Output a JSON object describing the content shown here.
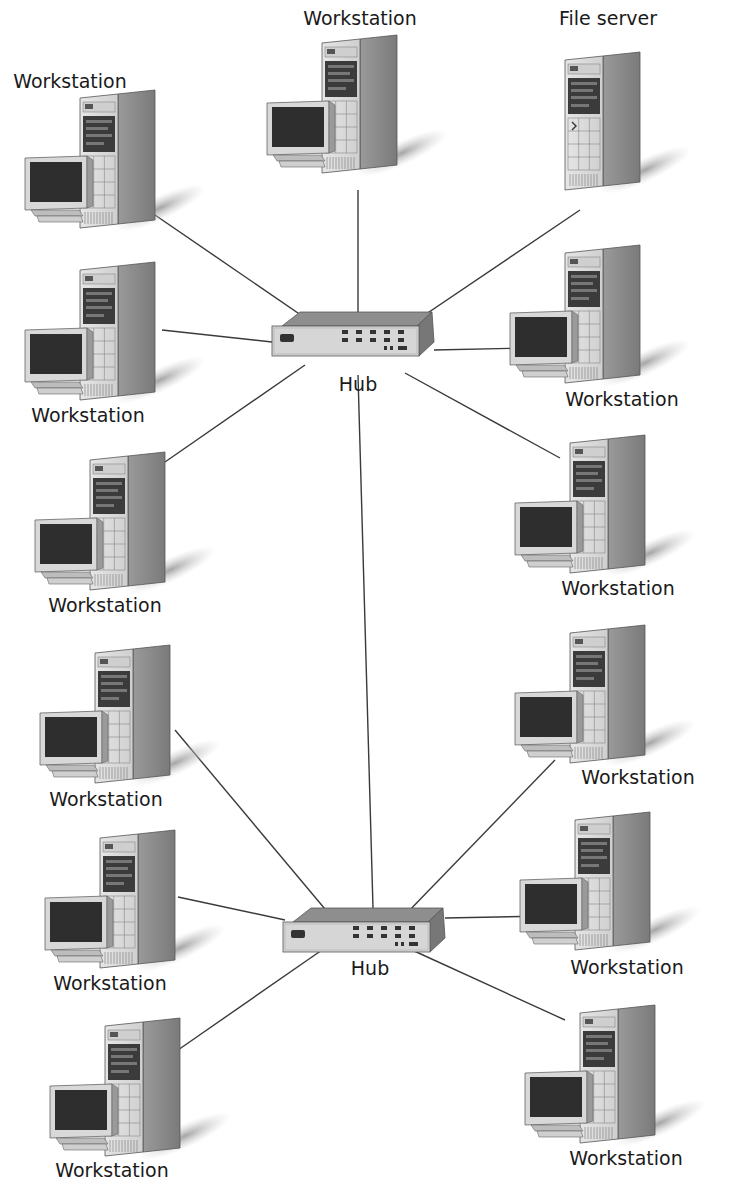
{
  "diagram": {
    "colors": {
      "line": "#3a3a3a",
      "case_front": "#dcdcdc",
      "case_side": "#8c8c8c",
      "screen": "#2e2e2e",
      "shadow": "#b0b0b0",
      "text": "#1a1a1a"
    },
    "hubs": [
      {
        "id": "hub1",
        "label": "Hub",
        "x": 272,
        "y": 312,
        "label_x": 358,
        "label_y": 391
      },
      {
        "id": "hub2",
        "label": "Hub",
        "x": 283,
        "y": 908,
        "label_x": 370,
        "label_y": 975
      }
    ],
    "nodes": [
      {
        "id": "n1",
        "type": "workstation",
        "label": "Workstation",
        "x": 20,
        "y": 90,
        "label_x": 70,
        "label_y": 88,
        "hub": "hub1",
        "from": [
          155,
          215
        ],
        "to": [
          330,
          335
        ]
      },
      {
        "id": "n2",
        "type": "workstation",
        "label": "Workstation",
        "x": 262,
        "y": 35,
        "label_x": 360,
        "label_y": 25,
        "hub": "hub1",
        "from": [
          358,
          190
        ],
        "to": [
          358,
          320
        ]
      },
      {
        "id": "n3",
        "type": "fileserver",
        "label": "File server",
        "label_x": 608,
        "label_y": 25,
        "x": 545,
        "y": 52,
        "hub": "hub1",
        "from": [
          580,
          210
        ],
        "to": [
          398,
          333
        ]
      },
      {
        "id": "n4",
        "type": "workstation",
        "label": "Workstation",
        "x": 20,
        "y": 262,
        "label_x": 88,
        "label_y": 422,
        "hub": "hub1",
        "from": [
          162,
          330
        ],
        "to": [
          272,
          342
        ]
      },
      {
        "id": "n5",
        "type": "workstation",
        "label": "Workstation",
        "x": 505,
        "y": 245,
        "label_x": 622,
        "label_y": 406,
        "hub": "hub1",
        "from": [
          434,
          350
        ],
        "to": [
          528,
          348
        ]
      },
      {
        "id": "n6",
        "type": "workstation",
        "label": "Workstation",
        "x": 30,
        "y": 452,
        "label_x": 105,
        "label_y": 612,
        "hub": "hub1",
        "from": [
          165,
          462
        ],
        "to": [
          305,
          365
        ]
      },
      {
        "id": "n7",
        "type": "workstation",
        "label": "Workstation",
        "x": 510,
        "y": 435,
        "label_x": 618,
        "label_y": 595,
        "hub": "hub1",
        "from": [
          405,
          373
        ],
        "to": [
          560,
          458
        ]
      },
      {
        "id": "n8",
        "type": "workstation",
        "label": "Workstation",
        "x": 35,
        "y": 645,
        "label_x": 106,
        "label_y": 806,
        "hub": "hub2",
        "from": [
          175,
          730
        ],
        "to": [
          330,
          915
        ]
      },
      {
        "id": "n9",
        "type": "workstation",
        "label": "Workstation",
        "x": 510,
        "y": 625,
        "label_x": 638,
        "label_y": 784,
        "hub": "hub2",
        "from": [
          555,
          760
        ],
        "to": [
          405,
          915
        ]
      },
      {
        "id": "n10",
        "type": "workstation",
        "label": "Workstation",
        "x": 40,
        "y": 830,
        "label_x": 110,
        "label_y": 990,
        "hub": "hub2",
        "from": [
          178,
          897
        ],
        "to": [
          285,
          920
        ]
      },
      {
        "id": "n11",
        "type": "workstation",
        "label": "Workstation",
        "x": 515,
        "y": 812,
        "label_x": 627,
        "label_y": 974,
        "hub": "hub2",
        "from": [
          445,
          918
        ],
        "to": [
          548,
          916
        ]
      },
      {
        "id": "n12",
        "type": "workstation",
        "label": "Workstation",
        "x": 45,
        "y": 1018,
        "label_x": 112,
        "label_y": 1177,
        "hub": "hub2",
        "from": [
          178,
          1050
        ],
        "to": [
          322,
          950
        ]
      },
      {
        "id": "n13",
        "type": "workstation",
        "label": "Workstation",
        "x": 520,
        "y": 1005,
        "label_x": 626,
        "label_y": 1165,
        "hub": "hub2",
        "from": [
          412,
          950
        ],
        "to": [
          565,
          1020
        ]
      }
    ],
    "backbone": {
      "from": [
        358,
        375
      ],
      "to": [
        373,
        908
      ]
    }
  }
}
